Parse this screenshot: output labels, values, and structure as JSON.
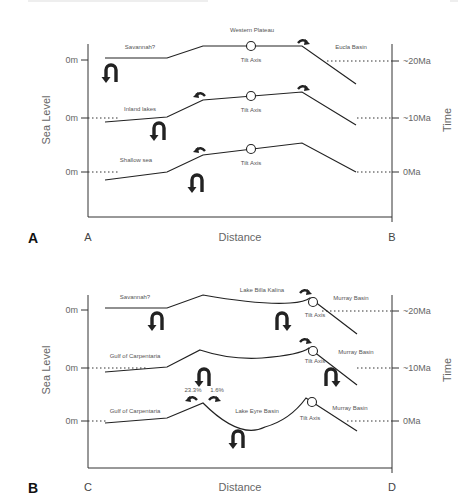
{
  "header": {
    "left": "",
    "right": ""
  },
  "panels": [
    {
      "id": "A",
      "panel_label": "A",
      "x_start_label": "A",
      "x_end_label": "B",
      "x_axis_title": "Distance",
      "y_axis_title": "Sea Level",
      "time_axis_title": "Time",
      "sea_level_ticks": [
        "0m",
        "0m",
        "0m"
      ],
      "time_ticks": [
        "~20Ma",
        "~10Ma",
        "0Ma"
      ],
      "profiles": [
        {
          "time": "~20Ma",
          "left_label": "Savannah?",
          "top_label": "Western Plateau",
          "tilt_label": "Tilt Axis",
          "right_label": "Eucla Basin"
        },
        {
          "time": "~10Ma",
          "left_label": "Inland lakes",
          "tilt_label": "Tilt Axis"
        },
        {
          "time": "0Ma",
          "left_label": "Shallow sea",
          "tilt_label": "Tilt Axis"
        }
      ]
    },
    {
      "id": "B",
      "panel_label": "B",
      "x_start_label": "C",
      "x_end_label": "D",
      "x_axis_title": "Distance",
      "y_axis_title": "Sea Level",
      "time_axis_title": "Time",
      "sea_level_ticks": [
        "0m",
        "0m",
        "0m"
      ],
      "time_ticks": [
        "~20Ma",
        "~10Ma",
        "0Ma"
      ],
      "profiles": [
        {
          "time": "~20Ma",
          "left_label": "Savannah?",
          "top_label": "Lake Billa Kalina",
          "tilt_label": "Tilt Axis",
          "right_label": "Murray Basin"
        },
        {
          "time": "~10Ma",
          "left_label": "Gulf of Carpentaria",
          "tilt_label": "Tilt Axis",
          "right_label": "Murray Basin"
        },
        {
          "time": "0Ma",
          "left_label": "Gulf of Carpentaria",
          "mid_label": "Lake Eyre Basin",
          "tilt_label": "Tilt Axis",
          "right_label": "Murray Basin",
          "pct_left": "23.3%",
          "pct_right": "1.6%"
        }
      ]
    }
  ]
}
